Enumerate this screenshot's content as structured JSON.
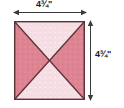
{
  "figure": {
    "type": "quilt-block-quarter-square-triangles",
    "square": {
      "top_triangle_color": "#f6dce3",
      "bottom_triangle_color": "#f6dce3",
      "left_triangle_color": "#dd8391",
      "right_triangle_color": "#dd8391",
      "border_color": "#5a3134",
      "diagonal_color": "#5a3134"
    },
    "dimensions": {
      "width": {
        "value": "4",
        "fraction": "3/4",
        "unit": "\"",
        "label": "4¾\"",
        "arrow": "double-headed-horizontal"
      },
      "height": {
        "value": "4",
        "fraction": "3/4",
        "unit": "\"",
        "label": "4¾\"",
        "arrow": "double-headed-vertical"
      }
    }
  }
}
